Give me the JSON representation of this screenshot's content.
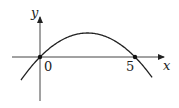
{
  "chart_data": {
    "type": "line",
    "title": "",
    "xlabel": "x",
    "ylabel": "y",
    "function": "y = a·x(5 − x), a > 0 (downward parabola)",
    "x_ticks": [
      "0",
      "5"
    ],
    "marked_points": [
      [
        0,
        0
      ],
      [
        5,
        0
      ]
    ],
    "x": [
      -1,
      0,
      0.5,
      1,
      1.5,
      2,
      2.5,
      3,
      3.5,
      4,
      4.5,
      5,
      5.5,
      5.9
    ],
    "series": [
      {
        "name": "curve",
        "values": [
          -6,
          0,
          2.25,
          4,
          5.25,
          6,
          6.25,
          6,
          5.25,
          4,
          2.25,
          0,
          -2.75,
          -5.31
        ]
      }
    ],
    "grid": false,
    "legend": "none"
  },
  "labels": {
    "x_axis": "x",
    "y_axis": "y",
    "origin": "0",
    "root": "5"
  }
}
